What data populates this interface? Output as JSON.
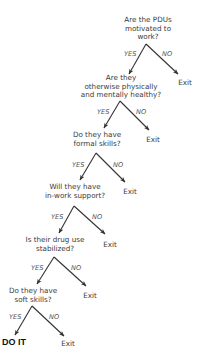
{
  "diagram": {
    "type": "decision-tree",
    "colors": {
      "text": "#3a3a3a",
      "arrow": "#333333",
      "branch_label": "#555555",
      "final": "#111111"
    },
    "branch_labels": {
      "yes": "YES",
      "no": "NO"
    },
    "nodes": [
      {
        "id": "q1",
        "lines": [
          "Are the PDUs",
          "motivated to",
          "work?"
        ],
        "no_outcome": "Exit"
      },
      {
        "id": "q2",
        "lines": [
          "Are they",
          "otherwise physically",
          "and mentally healthy?"
        ],
        "no_outcome": "Exit"
      },
      {
        "id": "q3",
        "lines": [
          "Do they have",
          "formal skills?"
        ],
        "no_outcome": "Exit"
      },
      {
        "id": "q4",
        "lines": [
          "Will they have",
          "in-work support?"
        ],
        "no_outcome": "Exit"
      },
      {
        "id": "q5",
        "lines": [
          "Is their drug use",
          "stabilized?"
        ],
        "no_outcome": "Exit"
      },
      {
        "id": "q6",
        "lines": [
          "Do they have",
          "soft skills?"
        ],
        "no_outcome": "Exit"
      }
    ],
    "final_yes_outcome": "DO IT"
  }
}
